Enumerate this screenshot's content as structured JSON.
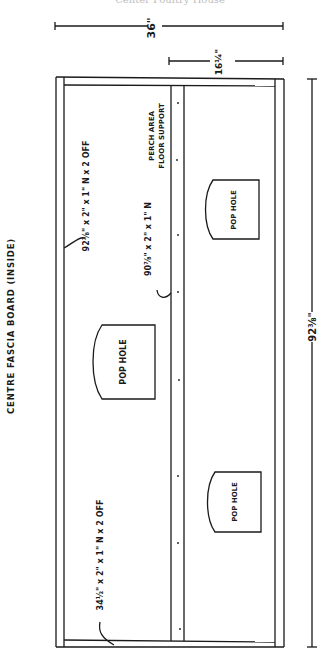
{
  "header": {
    "cut_caption": "Center Poultry House"
  },
  "drawing": {
    "title": "CENTRE FASCIA BOARD (INSIDE)",
    "dimensions": {
      "overall_width": "36\"",
      "half_width": "16¼\"",
      "overall_length": "92⅜\""
    },
    "labels": {
      "top_rail": "92⅜\" x 2\" x 1\" N x 2 OFF",
      "centre_support": "90⅞\" x 2\" x 1\" N",
      "centre_support_note_1": "PERCH AREA",
      "centre_support_note_2": "FLOOR SUPPORT",
      "end_rails": "34½\" x 2\" x 1\" N x 2 OFF"
    },
    "pop_holes": [
      {
        "label": "POP HOLE"
      },
      {
        "label": "POP HOLE"
      },
      {
        "label": "POP HOLE"
      }
    ],
    "colors": {
      "ink": "#1a1a1a",
      "paper": "#ffffff"
    }
  }
}
